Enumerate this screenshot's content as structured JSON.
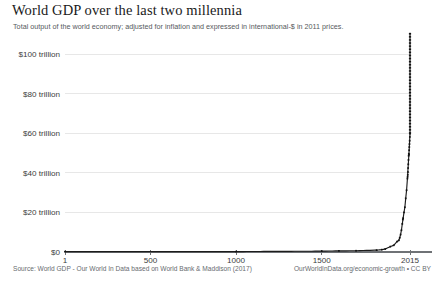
{
  "chart_data": {
    "type": "line",
    "title": "World GDP over the last two millennia",
    "subtitle": "Total output of the world economy; adjusted for inflation and expressed in international-$ in 2011 prices.",
    "xlabel": "",
    "ylabel": "",
    "xlim": [
      1,
      2015
    ],
    "ylim": [
      0,
      108
    ],
    "grid": true,
    "legend": "none",
    "y_unit": "trillion international-$ (2011 prices)",
    "x_ticks": [
      1,
      500,
      1000,
      1500,
      2015
    ],
    "x_tick_labels": [
      "1",
      "500",
      "1000",
      "1500",
      "2015"
    ],
    "y_ticks": [
      0,
      20,
      40,
      60,
      80,
      100
    ],
    "y_tick_labels": [
      "$0",
      "$20 trillion",
      "$40 trillion",
      "$60 trillion",
      "$80 trillion",
      "$100 trillion"
    ],
    "series": [
      {
        "name": "World GDP",
        "color": "#1c1c1c",
        "x": [
          1,
          1000,
          1500,
          1600,
          1700,
          1820,
          1850,
          1870,
          1900,
          1920,
          1940,
          1950,
          1955,
          1960,
          1965,
          1970,
          1973,
          1975,
          1980,
          1985,
          1990,
          1995,
          2000,
          2001,
          2002,
          2003,
          2004,
          2005,
          2006,
          2007,
          2008,
          2009,
          2010,
          2011,
          2012,
          2013,
          2014,
          2015
        ],
        "y": [
          0.18,
          0.21,
          0.43,
          0.57,
          0.64,
          0.94,
          1.18,
          1.5,
          2.7,
          3.4,
          5.3,
          5.9,
          7.2,
          8.8,
          11.0,
          14.2,
          16.4,
          17.1,
          20.0,
          22.6,
          27.1,
          31.2,
          37.1,
          38.0,
          39.0,
          40.4,
          42.4,
          44.3,
          46.5,
          48.6,
          49.6,
          49.2,
          51.4,
          53.0,
          54.5,
          56.2,
          58.1,
          59.8
        ]
      }
    ],
    "annotations": [],
    "dense_tail_note": "curve rises near-vertically after ~1850, peak plotted above the $100 trillion gridline"
  },
  "footer": {
    "source": "Source: World GDP - Our World In Data based on World Bank & Maddison (2017)",
    "attribution": "OurWorldInData.org/economic-growth • CC BY"
  }
}
